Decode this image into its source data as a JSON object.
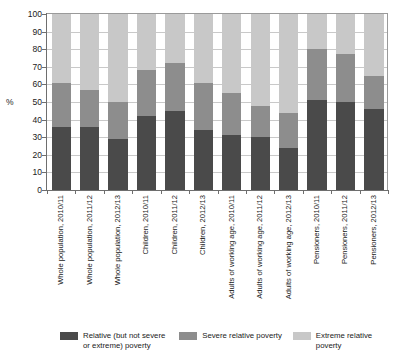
{
  "chart_data": {
    "type": "bar",
    "subtype": "stacked-bar-100",
    "title": "",
    "subtitle": "",
    "xlabel": "",
    "ylabel": "%",
    "ylim": [
      0,
      100
    ],
    "ytick_step": 10,
    "ytick_labels": [
      "100",
      "90",
      "80",
      "70",
      "60",
      "50",
      "40",
      "30",
      "20",
      "10",
      "0"
    ],
    "grid": true,
    "legend_position": "bottom",
    "categories": [
      "Whole population, 2010/11",
      "Whole population, 2011/12",
      "Whole population, 2012/13",
      "Children, 2010/11",
      "Children, 2011/12",
      "Children, 2012/13",
      "Adults of working age, 2010/11",
      "Adults of working age, 2011/12",
      "Adults of working age, 2012/13",
      "Pensioners, 2010/11",
      "Pensioners, 2011/12",
      "Pensioners, 2012/13"
    ],
    "series": [
      {
        "name": "Relative (but not severe or extreme) poverty",
        "color": "#4a4a4a",
        "values": [
          36,
          36,
          29,
          42,
          45,
          34,
          31,
          30,
          24,
          51,
          50,
          46
        ]
      },
      {
        "name": "Severe relative poverty",
        "color": "#8d8d8d",
        "values": [
          25,
          21,
          21,
          26,
          27,
          27,
          24,
          18,
          20,
          29,
          27,
          19
        ]
      },
      {
        "name": "Extreme relative poverty",
        "color": "#c8c8c8",
        "values": [
          39,
          43,
          50,
          32,
          28,
          39,
          45,
          52,
          56,
          20,
          23,
          35
        ]
      }
    ],
    "cumulative_tops": [
      [
        36,
        61,
        100
      ],
      [
        36,
        57,
        100
      ],
      [
        29,
        50,
        100
      ],
      [
        42,
        68,
        100
      ],
      [
        45,
        72,
        100
      ],
      [
        34,
        61,
        100
      ],
      [
        31,
        55,
        100
      ],
      [
        30,
        48,
        100
      ],
      [
        24,
        44,
        100
      ],
      [
        51,
        80,
        100
      ],
      [
        50,
        77,
        100
      ],
      [
        46,
        65,
        100
      ]
    ]
  },
  "axis": {
    "y_title": "%"
  },
  "legend": {
    "items": [
      {
        "label": "Relative (but not severe or extreme) poverty",
        "color": "#4a4a4a"
      },
      {
        "label": "Severe relative poverty",
        "color": "#8d8d8d"
      },
      {
        "label": "Extreme relative poverty",
        "color": "#c8c8c8"
      }
    ]
  }
}
